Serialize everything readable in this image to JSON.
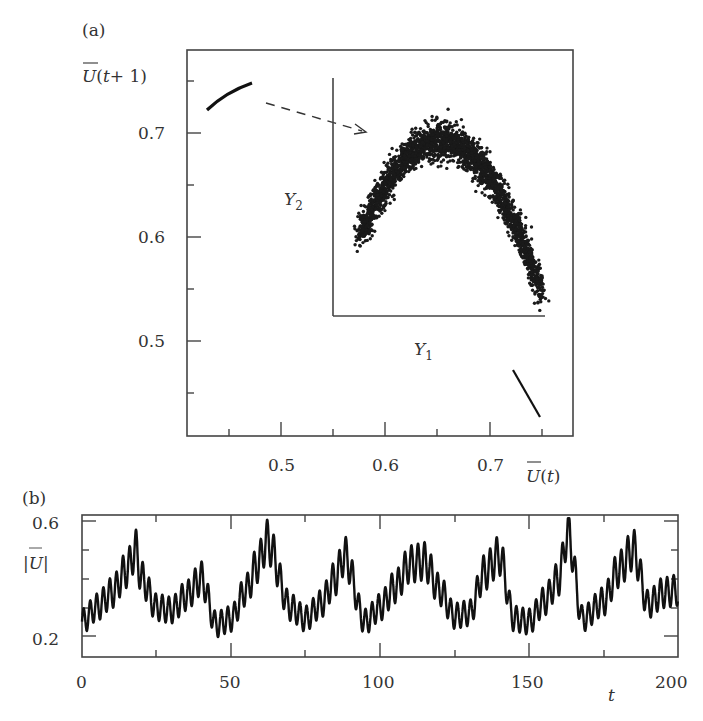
{
  "panel_a": {
    "label": "(a)",
    "ylabel": "U(t+1)",
    "xlabel": "U(t)",
    "yticks": [
      "0.7",
      "0.6",
      "0.5"
    ],
    "xticks": [
      "0.5",
      "0.6",
      "0.7"
    ],
    "inset": {
      "xlabel": "Y",
      "xlabel_sub": "1",
      "ylabel": "Y",
      "ylabel_sub": "2"
    }
  },
  "panel_b": {
    "label": "(b)",
    "ylabel": "|U|",
    "yticks": [
      "0.6",
      "0.2"
    ],
    "xticks": [
      "0",
      "50",
      "100",
      "150",
      "200"
    ],
    "xlabel": "t"
  },
  "chart_data": [
    {
      "type": "scatter",
      "title": "(a) Return map",
      "xlabel": "U(t)",
      "ylabel": "U(t+1)",
      "xlim": [
        0.41,
        0.78
      ],
      "ylim": [
        0.41,
        0.78
      ],
      "xticks": [
        0.5,
        0.6,
        0.7
      ],
      "yticks": [
        0.5,
        0.6,
        0.7
      ],
      "series": [
        {
          "name": "upper-left branch",
          "points": [
            [
              0.43,
              0.72
            ],
            [
              0.45,
              0.735
            ],
            [
              0.47,
              0.745
            ]
          ]
        },
        {
          "name": "lower-right branch",
          "points": [
            [
              0.72,
              0.475
            ],
            [
              0.735,
              0.45
            ],
            [
              0.75,
              0.425
            ]
          ]
        }
      ],
      "annotations": [
        "dashed arrow from upper-left branch to inset"
      ],
      "inset": {
        "type": "scatter",
        "xlabel": "Y1",
        "ylabel": "Y2",
        "shape": "inverted parabola (noisy band)",
        "approx_points": [
          [
            0.0,
            0.15
          ],
          [
            0.2,
            0.6
          ],
          [
            0.4,
            0.85
          ],
          [
            0.5,
            0.88
          ],
          [
            0.6,
            0.82
          ],
          [
            0.8,
            0.5
          ],
          [
            1.0,
            0.05
          ]
        ]
      }
    },
    {
      "type": "line",
      "title": "(b) Time series",
      "xlabel": "t",
      "ylabel": "|U|",
      "xlim": [
        0,
        200
      ],
      "ylim": [
        0.17,
        0.62
      ],
      "xticks": [
        0,
        50,
        100,
        150,
        200
      ],
      "yticks": [
        0.2,
        0.3,
        0.4,
        0.5,
        0.6
      ],
      "x": [
        0,
        5,
        10,
        15,
        18,
        20,
        25,
        30,
        35,
        40,
        45,
        50,
        55,
        59,
        62,
        70,
        75,
        80,
        85,
        88,
        95,
        100,
        105,
        110,
        115,
        120,
        125,
        130,
        135,
        140,
        145,
        150,
        155,
        160,
        163,
        168,
        175,
        180,
        185,
        190,
        195,
        200
      ],
      "values": [
        0.27,
        0.32,
        0.37,
        0.45,
        0.52,
        0.42,
        0.32,
        0.31,
        0.36,
        0.42,
        0.26,
        0.28,
        0.38,
        0.47,
        0.55,
        0.32,
        0.28,
        0.33,
        0.42,
        0.5,
        0.27,
        0.32,
        0.39,
        0.47,
        0.48,
        0.38,
        0.29,
        0.3,
        0.44,
        0.5,
        0.28,
        0.27,
        0.34,
        0.42,
        0.58,
        0.28,
        0.34,
        0.45,
        0.52,
        0.33,
        0.37,
        0.38
      ]
    }
  ]
}
